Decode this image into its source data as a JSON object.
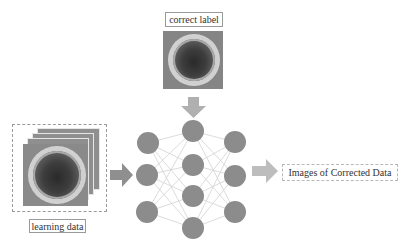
{
  "diagram": {
    "title_labels": {
      "correct_label": "correct label",
      "learning_data": "learning data",
      "output": "Images of Corrected Data"
    },
    "colors": {
      "node": "#8c8c8c",
      "edge": "#cfcfcf",
      "arrow": "#a6a6a6",
      "border": "#9a9a9a"
    },
    "network": {
      "layers": [
        {
          "name": "input",
          "nodes": 3
        },
        {
          "name": "hidden",
          "nodes": 4
        },
        {
          "name": "output",
          "nodes": 3
        }
      ]
    },
    "images": {
      "correct_label_image": "petri-dish-photo",
      "learning_data_stack": "petri-dish-photo-stack"
    },
    "arrows": [
      {
        "from": "learning_data",
        "to": "network",
        "direction": "right"
      },
      {
        "from": "correct_label",
        "to": "network",
        "direction": "down"
      },
      {
        "from": "network",
        "to": "output",
        "direction": "right"
      }
    ]
  }
}
